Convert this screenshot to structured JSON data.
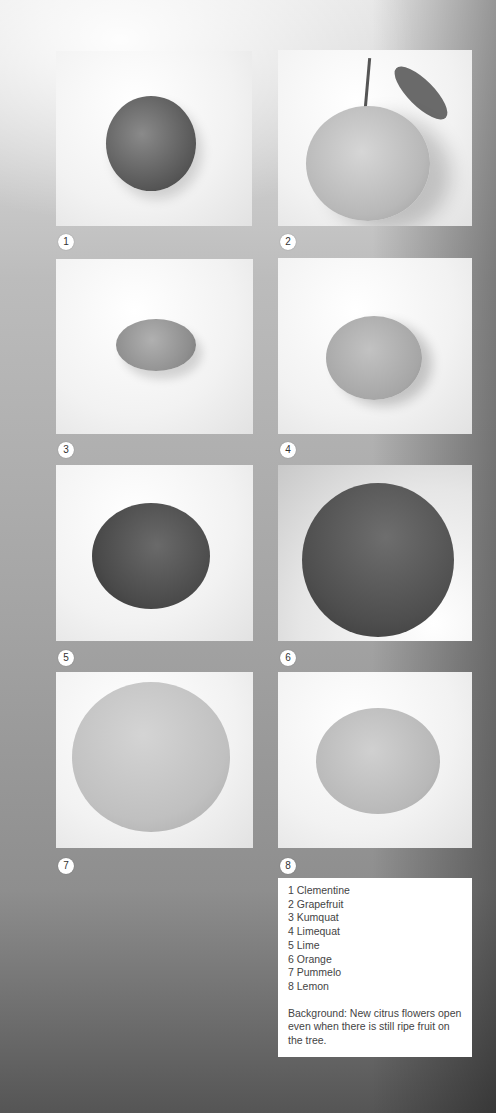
{
  "panels": [
    {
      "number": "1",
      "name": "Clementine"
    },
    {
      "number": "2",
      "name": "Grapefruit"
    },
    {
      "number": "3",
      "name": "Kumquat"
    },
    {
      "number": "4",
      "name": "Limequat"
    },
    {
      "number": "5",
      "name": "Lime"
    },
    {
      "number": "6",
      "name": "Orange"
    },
    {
      "number": "7",
      "name": "Pummelo"
    },
    {
      "number": "8",
      "name": "Lemon"
    }
  ],
  "caption": {
    "items": [
      "1 Clementine",
      "2 Grapefruit",
      "3 Kumquat",
      "4 Limequat",
      "5 Lime",
      "6 Orange",
      "7 Pummelo",
      "8 Lemon"
    ],
    "background_note": "Background: New citrus flowers open even when there is still ripe fruit on the tree."
  }
}
